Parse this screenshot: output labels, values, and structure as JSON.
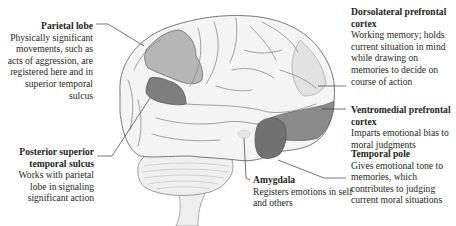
{
  "figure": {
    "type": "annotated brain diagram (lateral view, left hemisphere, frontal lobe on right)",
    "colors": {
      "brain_base": "#f3f3f3",
      "gyri_outline": "#8a8a8a",
      "region_light_highlight": "#b4b4b4",
      "region_dark_highlight": "#7c7c7c",
      "leader_line": "#3a3a3a",
      "text": "#231f20"
    }
  },
  "labels": {
    "parietal": {
      "title": "Parietal lobe",
      "desc": "Physically significant movements, such as acts of aggression, are registered here and in superior temporal sulcus"
    },
    "posterior_superior_temporal_sulcus": {
      "title": "Posterior superior temporal sulcus",
      "desc": "Works with parietal lobe in signaling significant action"
    },
    "dorsolateral_prefrontal_cortex": {
      "title": "Dorsolateral prefrontal cortex",
      "desc": "Working memory; holds current situation in mind while drawing on memories to decide on course of action"
    },
    "ventromedial_prefrontal_cortex": {
      "title": "Ventromedial prefrontal cortex",
      "desc": "Imparts emotional bias to moral judgments"
    },
    "temporal_pole": {
      "title": "Temporal pole",
      "desc": "Gives emotional tone to memories, which contributes to judging current moral situations"
    },
    "amygdala": {
      "title": "Amygdala",
      "desc": "Registers emotions in self and others"
    }
  }
}
